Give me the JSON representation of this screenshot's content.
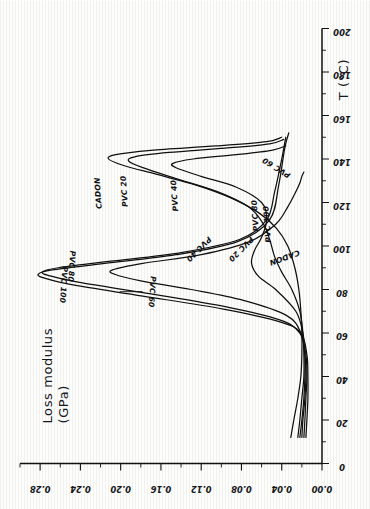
{
  "figure": {
    "kind": "scanned-line-chart",
    "orientation_note": "figure printed sideways on the page (rotated 90 degrees counter-clockwise)",
    "background_color": "#fdfdfc",
    "ink_color": "#111111"
  },
  "chart_data": {
    "type": "line",
    "title": "",
    "xlabel": "T (°C)",
    "ylabel": "Loss modulus (GPa)",
    "xlim": [
      0,
      200
    ],
    "ylim": [
      0.0,
      0.3
    ],
    "grid": false,
    "legend": "inline-curve-labels",
    "x_ticks": [
      0,
      20,
      40,
      60,
      80,
      100,
      120,
      140,
      160,
      180,
      200
    ],
    "x_tick_labels": [
      "0",
      "20",
      "40",
      "60",
      "80",
      "100",
      "120",
      "140",
      "160",
      "180",
      "200"
    ],
    "x_minor_step": 10,
    "y_ticks": [
      0.0,
      0.04,
      0.08,
      0.12,
      0.16,
      0.2,
      0.24,
      0.28
    ],
    "y_tick_labels": [
      "0.00",
      "0.04",
      "0.08",
      "0.12",
      "0.16",
      "0.20",
      "0.24",
      "0.28"
    ],
    "y_minor_step": 0.02,
    "series": [
      {
        "name": "CADON",
        "peak_T": 140,
        "peak_value": 0.212,
        "x": [
          12,
          20,
          30,
          40,
          50,
          60,
          70,
          80,
          90,
          100,
          108,
          115,
          122,
          128,
          133,
          137,
          140,
          142,
          144,
          146,
          148,
          150
        ],
        "y": [
          0.031,
          0.028,
          0.024,
          0.021,
          0.02,
          0.02,
          0.021,
          0.023,
          0.027,
          0.034,
          0.045,
          0.062,
          0.09,
          0.125,
          0.165,
          0.197,
          0.212,
          0.205,
          0.17,
          0.105,
          0.055,
          0.04
        ]
      },
      {
        "name": "PVC 20",
        "peak_T": 139,
        "peak_value": 0.192,
        "x": [
          12,
          20,
          30,
          40,
          50,
          60,
          70,
          80,
          88,
          95,
          103,
          110,
          118,
          125,
          131,
          136,
          139,
          141,
          143,
          145,
          147,
          149
        ],
        "y": [
          0.024,
          0.022,
          0.02,
          0.018,
          0.018,
          0.019,
          0.022,
          0.03,
          0.04,
          0.047,
          0.052,
          0.058,
          0.073,
          0.104,
          0.145,
          0.178,
          0.192,
          0.186,
          0.152,
          0.096,
          0.052,
          0.038
        ]
      },
      {
        "name": "PVC 40",
        "peak_T": 137,
        "peak_value": 0.148,
        "x": [
          12,
          20,
          30,
          40,
          50,
          60,
          70,
          80,
          86,
          92,
          98,
          104,
          112,
          120,
          127,
          132,
          136,
          138,
          140,
          142,
          144,
          146
        ],
        "y": [
          0.022,
          0.02,
          0.018,
          0.017,
          0.017,
          0.019,
          0.026,
          0.046,
          0.063,
          0.07,
          0.067,
          0.06,
          0.055,
          0.06,
          0.085,
          0.12,
          0.145,
          0.148,
          0.128,
          0.085,
          0.05,
          0.036
        ]
      },
      {
        "name": "PVC 60",
        "peak_T": 88,
        "peak_value": 0.208,
        "x": [
          12,
          20,
          30,
          40,
          50,
          60,
          68,
          75,
          80,
          84,
          87,
          89,
          92,
          96,
          102,
          110,
          118,
          124,
          129,
          132,
          134
        ],
        "y": [
          0.02,
          0.019,
          0.017,
          0.016,
          0.017,
          0.021,
          0.035,
          0.078,
          0.13,
          0.18,
          0.206,
          0.208,
          0.178,
          0.12,
          0.072,
          0.046,
          0.034,
          0.027,
          0.022,
          0.02,
          0.018
        ]
      },
      {
        "name": "PVC 80",
        "peak_T": 88,
        "peak_value": 0.278,
        "x": [
          12,
          20,
          30,
          40,
          50,
          60,
          66,
          72,
          78,
          83,
          86,
          88,
          90,
          93,
          97,
          103,
          112,
          125,
          140,
          150
        ],
        "y": [
          0.018,
          0.017,
          0.016,
          0.015,
          0.016,
          0.022,
          0.042,
          0.095,
          0.17,
          0.238,
          0.268,
          0.278,
          0.262,
          0.21,
          0.14,
          0.082,
          0.055,
          0.047,
          0.04,
          0.036
        ]
      },
      {
        "name": "PVC 100",
        "peak_T": 87,
        "peak_value": 0.282,
        "x": [
          12,
          20,
          30,
          40,
          50,
          60,
          65,
          71,
          77,
          82,
          85,
          87,
          89,
          92,
          96,
          102,
          112,
          128,
          145,
          152
        ],
        "y": [
          0.016,
          0.015,
          0.014,
          0.014,
          0.015,
          0.021,
          0.041,
          0.098,
          0.178,
          0.246,
          0.274,
          0.282,
          0.268,
          0.216,
          0.145,
          0.084,
          0.052,
          0.043,
          0.037,
          0.033
        ]
      }
    ],
    "annotations": [
      {
        "text": "CADON",
        "near_T": 140,
        "near_value": 0.215,
        "placement": "upper-left-of-peak"
      },
      {
        "text": "PVC 20",
        "near_T": 139,
        "near_value": 0.19,
        "placement": "left-of-peak"
      },
      {
        "text": "PVC 40",
        "near_T": 137,
        "near_value": 0.14,
        "placement": "left-of-peak"
      },
      {
        "text": "PVC 60",
        "near_T": 125,
        "near_value": 0.032,
        "placement": "along-tail"
      },
      {
        "text": "PVC 80",
        "near_T": 103,
        "near_value": 0.06,
        "placement": "along-tail"
      },
      {
        "text": "PVC 100",
        "near_T": 99,
        "near_value": 0.048,
        "placement": "along-tail"
      },
      {
        "text": "PVC 80",
        "near_T": 88,
        "near_value": 0.262,
        "placement": "inverted-at-peak"
      },
      {
        "text": "PVC 100",
        "near_T": 85,
        "near_value": 0.276,
        "placement": "inverted-at-peak"
      },
      {
        "text": "PVC 60",
        "near_T": 79,
        "near_value": 0.205,
        "placement": "inverted-with-leader"
      },
      {
        "text": "PVC 40",
        "near_T": 92,
        "near_value": 0.14,
        "placement": "inverted-on-rise"
      },
      {
        "text": "PVC 20",
        "near_T": 92,
        "near_value": 0.098,
        "placement": "inverted-on-rise"
      },
      {
        "text": "CADON",
        "near_T": 92,
        "near_value": 0.058,
        "placement": "inverted-on-rise"
      }
    ]
  },
  "labels": {
    "y_axis_line1": "Loss modulus",
    "y_axis_line2": "(GPa)",
    "x_axis": "T (°C)"
  }
}
